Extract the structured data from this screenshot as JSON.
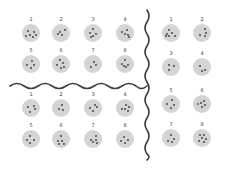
{
  "colors": {
    "plate": "#d4d4d4",
    "dot": "#3a3a3a",
    "divider": "#3c3c3c",
    "background": "#ffffff"
  },
  "groups": [
    {
      "name": "top-left",
      "plates": [
        {
          "label": "1",
          "x": 31,
          "y": 33,
          "dots": [
            [
              -3,
              -2
            ],
            [
              3,
              -1
            ],
            [
              -1,
              2
            ],
            [
              2,
              4
            ],
            [
              -5,
              3
            ],
            [
              5,
              2
            ]
          ]
        },
        {
          "label": "2",
          "x": 61,
          "y": 33,
          "dots": [
            [
              4,
              -3
            ],
            [
              -3,
              1
            ],
            [
              1,
              2
            ],
            [
              -1,
              -1
            ]
          ]
        },
        {
          "label": "3",
          "x": 93,
          "y": 33,
          "dots": [
            [
              0,
              -4
            ],
            [
              -3,
              0
            ],
            [
              3,
              1
            ],
            [
              0,
              3
            ],
            [
              -2,
              4
            ]
          ]
        },
        {
          "label": "4",
          "x": 125,
          "y": 33,
          "dots": [
            [
              -3,
              -1
            ],
            [
              2,
              -3
            ],
            [
              3,
              2
            ],
            [
              0,
              1
            ],
            [
              4,
              4
            ]
          ]
        },
        {
          "label": "5",
          "x": 31,
          "y": 64,
          "dots": [
            [
              1,
              -3
            ],
            [
              -4,
              1
            ],
            [
              3,
              1
            ],
            [
              0,
              4
            ]
          ]
        },
        {
          "label": "6",
          "x": 61,
          "y": 64,
          "dots": [
            [
              -1,
              -4
            ],
            [
              2,
              -1
            ],
            [
              -4,
              1
            ],
            [
              3,
              3
            ],
            [
              0,
              4
            ]
          ]
        },
        {
          "label": "7",
          "x": 93,
          "y": 64,
          "dots": [
            [
              1,
              -2
            ],
            [
              3,
              1
            ],
            [
              -2,
              3
            ]
          ]
        },
        {
          "label": "8",
          "x": 125,
          "y": 64,
          "dots": [
            [
              0,
              -4
            ],
            [
              -3,
              0
            ],
            [
              3,
              1
            ],
            [
              1,
              3
            ],
            [
              -1,
              2
            ]
          ]
        }
      ]
    },
    {
      "name": "bottom-left",
      "plates": [
        {
          "label": "1",
          "x": 31,
          "y": 108,
          "dots": [
            [
              3,
              -2
            ],
            [
              -3,
              -1
            ],
            [
              4,
              1
            ],
            [
              -1,
              4
            ]
          ]
        },
        {
          "label": "2",
          "x": 61,
          "y": 108,
          "dots": [
            [
              1,
              -3
            ],
            [
              -2,
              1
            ],
            [
              2,
              2
            ]
          ]
        },
        {
          "label": "3",
          "x": 93,
          "y": 108,
          "dots": [
            [
              2,
              -3
            ],
            [
              -3,
              0
            ],
            [
              4,
              -1
            ],
            [
              0,
              3
            ]
          ]
        },
        {
          "label": "4",
          "x": 125,
          "y": 108,
          "dots": [
            [
              1,
              -3
            ],
            [
              4,
              -1
            ],
            [
              -3,
              1
            ],
            [
              0,
              1
            ],
            [
              3,
              3
            ]
          ]
        },
        {
          "label": "5",
          "x": 31,
          "y": 139,
          "dots": [
            [
              -1,
              -3
            ],
            [
              -4,
              1
            ],
            [
              3,
              1
            ],
            [
              -1,
              4
            ]
          ]
        },
        {
          "label": "6",
          "x": 61,
          "y": 139,
          "dots": [
            [
              0,
              -3
            ],
            [
              -3,
              2
            ],
            [
              1,
              2
            ],
            [
              -2,
              5
            ],
            [
              3,
              5
            ]
          ]
        },
        {
          "label": "7",
          "x": 93,
          "y": 139,
          "dots": [
            [
              3,
              -3
            ],
            [
              -2,
              1
            ],
            [
              3,
              1
            ],
            [
              0,
              3
            ],
            [
              4,
              4
            ]
          ]
        },
        {
          "label": "8",
          "x": 125,
          "y": 139,
          "dots": [
            [
              -1,
              -2
            ],
            [
              -4,
              2
            ],
            [
              3,
              1
            ],
            [
              0,
              4
            ]
          ]
        }
      ]
    },
    {
      "name": "right",
      "plates": [
        {
          "label": "1",
          "x": 171,
          "y": 33,
          "dots": [
            [
              -2,
              -3
            ],
            [
              -4,
              1
            ],
            [
              1,
              0
            ],
            [
              -2,
              3
            ],
            [
              4,
              3
            ],
            [
              -5,
              3
            ]
          ]
        },
        {
          "label": "2",
          "x": 202,
          "y": 33,
          "dots": [
            [
              3,
              -4
            ],
            [
              4,
              0
            ],
            [
              -2,
              2
            ],
            [
              3,
              3
            ]
          ]
        },
        {
          "label": "3",
          "x": 171,
          "y": 67,
          "dots": [
            [
              -2,
              -2
            ],
            [
              3,
              -1
            ],
            [
              -2,
              3
            ]
          ]
        },
        {
          "label": "4",
          "x": 202,
          "y": 67,
          "dots": [
            [
              -2,
              -1
            ],
            [
              3,
              3
            ],
            [
              0,
              4
            ]
          ]
        },
        {
          "label": "5",
          "x": 171,
          "y": 104,
          "dots": [
            [
              1,
              -4
            ],
            [
              -4,
              0
            ],
            [
              3,
              1
            ],
            [
              0,
              4
            ]
          ]
        },
        {
          "label": "6",
          "x": 202,
          "y": 104,
          "dots": [
            [
              2,
              -3
            ],
            [
              -1,
              -1
            ],
            [
              -4,
              0
            ],
            [
              3,
              1
            ],
            [
              0,
              3
            ]
          ]
        },
        {
          "label": "7",
          "x": 171,
          "y": 138,
          "dots": [
            [
              0,
              -3
            ],
            [
              3,
              1
            ],
            [
              -3,
              3
            ],
            [
              1,
              4
            ]
          ]
        },
        {
          "label": "8",
          "x": 202,
          "y": 138,
          "dots": [
            [
              -2,
              -3
            ],
            [
              2,
              -3
            ],
            [
              0,
              0
            ],
            [
              4,
              1
            ],
            [
              -3,
              3
            ],
            [
              2,
              4
            ]
          ]
        }
      ]
    }
  ],
  "dividers": {
    "vertical": {
      "x": 147,
      "y_start": 10,
      "y_end": 160
    },
    "horizontal": {
      "y": 86,
      "x_start": 10,
      "x_end": 147
    }
  }
}
